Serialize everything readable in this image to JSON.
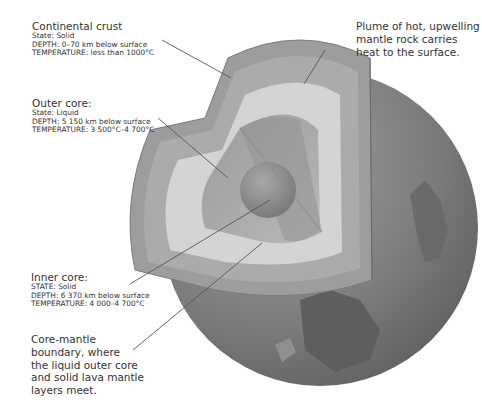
{
  "labels": {
    "continental_crust": {
      "title": "Continental crust",
      "state": "State: Solid",
      "depth": "DEPTH: 0–70 km below surface",
      "temperature": "TEMPERATURE: less than 1000°C"
    },
    "plume": {
      "line1": "Plume of hot, upwelling",
      "line2": "mantle rock carries",
      "line3": "heat to the surface."
    },
    "outer_core": {
      "title": "Outer core:",
      "state": "State: Liquid",
      "depth": "DEPTH: 5 150 km below surface",
      "temperature": "TEMPERATURE: 3 500°C–4 700°C"
    },
    "inner_core": {
      "title": "Inner core:",
      "state": "STATE: Solid",
      "depth": "DEPTH: 6 370 km below surface",
      "temperature": "TEMPERATURE: 4 000–4 700°C"
    },
    "core_mantle": {
      "line1": "Core-mantle",
      "line2": "boundary, where",
      "line3": "the liquid outer core",
      "line4": "and solid lava mantle",
      "line5": "layers meet."
    }
  },
  "colors": {
    "background": "#ffffff",
    "surface_dark": "#6e6e6e",
    "surface_light": "#8f8f8f",
    "crust": "#9a9a9a",
    "mantle_outer": "#a9a9a9",
    "mantle_inner": "#d2d2d2",
    "outer_core": "#a3a3a3",
    "inner_core": "#8a8a8a",
    "leader_line": "#555555"
  }
}
